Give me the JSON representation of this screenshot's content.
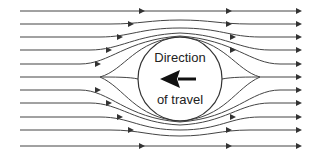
{
  "diagram": {
    "type": "streamlines-around-cylinder",
    "label_top": "Direction",
    "label_bottom": "of travel",
    "arrow_direction": "left",
    "line_color": "#333333",
    "object": {
      "shape": "circle",
      "cx": 180,
      "cy": 79,
      "r": 42
    },
    "streamline_count": 11
  }
}
